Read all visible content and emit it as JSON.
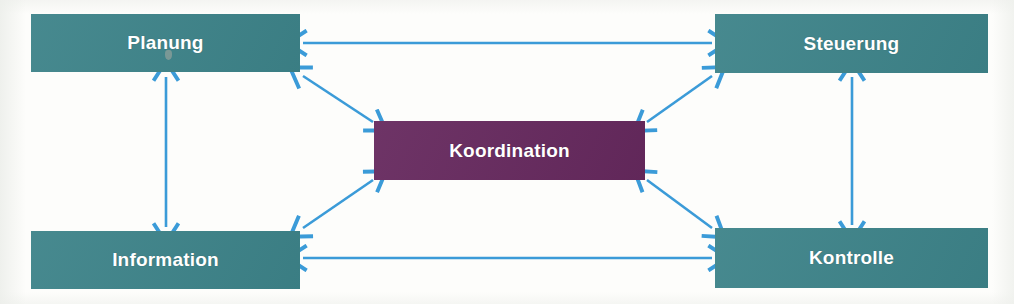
{
  "diagram": {
    "title": "Koordination",
    "background_color": "#fdfdfb",
    "node_color_teal": "#3d8389",
    "node_color_purple": "#66295e",
    "arrow_color": "#3b9bd8",
    "label_color": "#ffffff",
    "nodes": [
      {
        "id": "planung",
        "label": "Planung",
        "color": "#3d8389",
        "x": 31,
        "y": 14,
        "w": 269,
        "h": 58
      },
      {
        "id": "steuerung",
        "label": "Steuerung",
        "color": "#3d8389",
        "x": 715,
        "y": 14,
        "w": 273,
        "h": 59
      },
      {
        "id": "koordination",
        "label": "Koordination",
        "color": "#66295e",
        "x": 374,
        "y": 121,
        "w": 271,
        "h": 59
      },
      {
        "id": "information",
        "label": "Information",
        "color": "#3d8389",
        "x": 31,
        "y": 231,
        "w": 269,
        "h": 58
      },
      {
        "id": "kontrolle",
        "label": "Kontrolle",
        "color": "#3d8389",
        "x": 715,
        "y": 228,
        "w": 273,
        "h": 60
      }
    ],
    "connections": [
      {
        "id": "planung-steuerung",
        "from": "planung",
        "to": "steuerung",
        "style": "double-arrow",
        "orientation": "horizontal"
      },
      {
        "id": "information-kontrolle",
        "from": "information",
        "to": "kontrolle",
        "style": "double-arrow",
        "orientation": "horizontal"
      },
      {
        "id": "planung-information",
        "from": "planung",
        "to": "information",
        "style": "double-arrow",
        "orientation": "vertical"
      },
      {
        "id": "steuerung-kontrolle",
        "from": "steuerung",
        "to": "kontrolle",
        "style": "double-arrow",
        "orientation": "vertical"
      },
      {
        "id": "planung-koordination",
        "from": "planung",
        "to": "koordination",
        "style": "double-arrow",
        "orientation": "diagonal"
      },
      {
        "id": "steuerung-koordination",
        "from": "steuerung",
        "to": "koordination",
        "style": "double-arrow",
        "orientation": "diagonal"
      },
      {
        "id": "information-koordination",
        "from": "information",
        "to": "koordination",
        "style": "double-arrow",
        "orientation": "diagonal"
      },
      {
        "id": "kontrolle-koordination",
        "from": "kontrolle",
        "to": "koordination",
        "style": "double-arrow",
        "orientation": "diagonal"
      }
    ]
  }
}
